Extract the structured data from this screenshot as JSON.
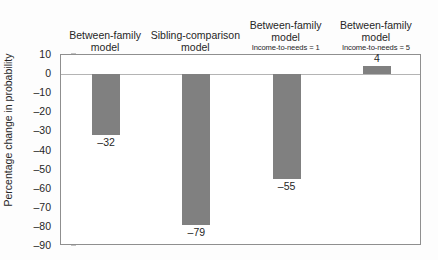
{
  "chart_data": {
    "type": "bar",
    "title": "",
    "xlabel": "",
    "ylabel": "Percentage change in probability",
    "ylim": [
      -90,
      10
    ],
    "ytick_step": 10,
    "yticks": [
      "10",
      "0",
      "–10",
      "–20",
      "–30",
      "–40",
      "–50",
      "–60",
      "–70",
      "–80",
      "–90"
    ],
    "ytick_values": [
      10,
      0,
      -10,
      -20,
      -30,
      -40,
      -50,
      -60,
      -70,
      -80,
      -90
    ],
    "grid": false,
    "legend": "none",
    "zero_line": 0,
    "bar_color": "#808080",
    "categories": [
      "Between-family model",
      "Sibling-comparison model",
      "Between-family model Income-to-needs = 1",
      "Between-family model Income-to-needs = 5"
    ],
    "values": [
      -32,
      -79,
      -55,
      4
    ],
    "data_labels": [
      "–32",
      "–79",
      "–55",
      "4"
    ],
    "columns": [
      {
        "line1": "Between-family",
        "line2": "model",
        "line3": ""
      },
      {
        "line1": "Sibling-comparison",
        "line2": "model",
        "line3": ""
      },
      {
        "line1": "Between-family",
        "line2": "model",
        "line3": "Income-to-needs = 1"
      },
      {
        "line1": "Between-family",
        "line2": "model",
        "line3": "Income-to-needs = 5"
      }
    ]
  }
}
